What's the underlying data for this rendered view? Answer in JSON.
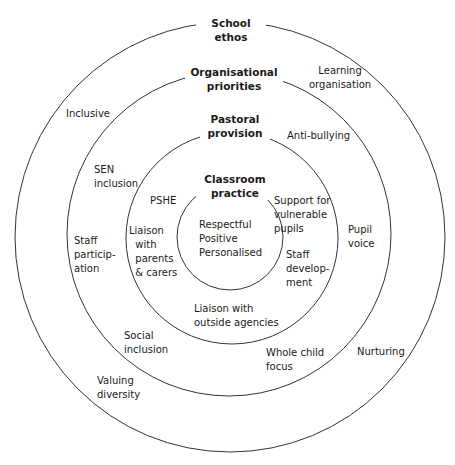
{
  "diagram": {
    "type": "concentric-circles",
    "rings": [
      {
        "name": "outer",
        "title": "School\nethos",
        "items": [
          "Learning\norganisation",
          "Inclusive",
          "Pupil\nvoice",
          "Nurturing",
          "Valuing\ndiversity"
        ]
      },
      {
        "name": "second",
        "title": "Organisational\npriorities",
        "items": [
          "Anti-bullying",
          "SEN\ninclusion",
          "Staff\nparticip-\nation",
          "Social\ninclusion",
          "Whole child\nfocus"
        ]
      },
      {
        "name": "third",
        "title": "Pastoral\nprovision",
        "items": [
          "PSHE",
          "Liaison\n  with\n  parents\n  & carers",
          "Support for\nvulnerable\npupils",
          "Staff\ndevelop-\nment",
          "Liaison with\noutside agencies"
        ]
      },
      {
        "name": "inner",
        "title": "Classroom\npractice",
        "items": [
          "Respectful\nPositive\nPersonalised"
        ]
      }
    ]
  },
  "colors": {
    "line": "#333333",
    "text": "#1a1a1a",
    "background": "#ffffff"
  }
}
